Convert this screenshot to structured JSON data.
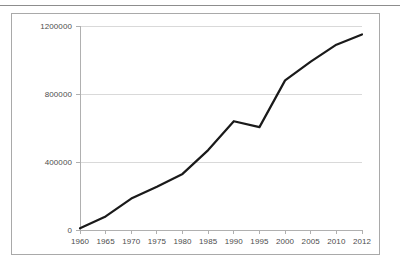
{
  "page": {
    "background_color": "#ffffff",
    "rule_color": "#8d8d8d",
    "frame_color": "#a9a9a9"
  },
  "chart_data": {
    "type": "line",
    "title": "",
    "subtitle": "",
    "xlabel": "",
    "ylabel": "",
    "x": [
      1960,
      1965,
      1970,
      1975,
      1980,
      1985,
      1990,
      1995,
      2000,
      2005,
      2010,
      2012
    ],
    "categories": [
      "1960",
      "1965",
      "1970",
      "1975",
      "1980",
      "1985",
      "1990",
      "1995",
      "2000",
      "2005",
      "2010",
      "2012"
    ],
    "values": [
      10000,
      80000,
      185000,
      255000,
      330000,
      470000,
      640000,
      605000,
      880000,
      990000,
      1090000,
      1150000
    ],
    "series": [
      {
        "name": "",
        "color": "#1a1a1a",
        "line_width": 2.2,
        "markers": false,
        "values": [
          10000,
          80000,
          185000,
          255000,
          330000,
          470000,
          640000,
          605000,
          880000,
          990000,
          1090000,
          1150000
        ]
      }
    ],
    "ylim": [
      0,
      1200000
    ],
    "ytick_labels": [
      "0",
      "400000",
      "800000",
      "1200000"
    ],
    "ytick_values": [
      0,
      400000,
      800000,
      1200000
    ],
    "xtick_labels": [
      "1960",
      "1965",
      "1970",
      "1975",
      "1980",
      "1985",
      "1990",
      "1995",
      "2000",
      "2005",
      "2010",
      "2012"
    ],
    "grid": {
      "horizontal": true,
      "vertical": false,
      "color": "#d9d9d9"
    },
    "legend": {
      "visible": false,
      "position": "none",
      "entries": []
    },
    "axis_color": "#b0b0b0",
    "tick_label_color": "#4d4d4d"
  }
}
